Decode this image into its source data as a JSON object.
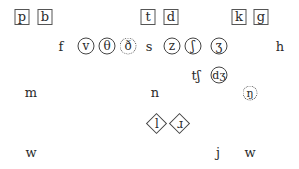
{
  "diagram": {
    "type": "phoneme-chart",
    "legend_markers": {
      "box": "plosive",
      "circle": "fricative/affricate",
      "dotted-circle": "marked phoneme",
      "diamond": "approximant/liquid",
      "plain": "unmarked"
    },
    "rows": [
      {
        "row": 1,
        "symbols": [
          {
            "label": "p",
            "marker": "box"
          },
          {
            "label": "b",
            "marker": "box"
          },
          {
            "label": "t",
            "marker": "box"
          },
          {
            "label": "d",
            "marker": "box"
          },
          {
            "label": "k",
            "marker": "box"
          },
          {
            "label": "g",
            "marker": "box"
          }
        ]
      },
      {
        "row": 2,
        "symbols": [
          {
            "label": "f",
            "marker": "plain"
          },
          {
            "label": "v",
            "marker": "circle"
          },
          {
            "label": "θ",
            "marker": "circle"
          },
          {
            "label": "ð",
            "marker": "dotted-circle"
          },
          {
            "label": "s",
            "marker": "plain"
          },
          {
            "label": "z",
            "marker": "circle"
          },
          {
            "label": "ʃ",
            "marker": "circle"
          },
          {
            "label": "ʒ",
            "marker": "circle"
          },
          {
            "label": "h",
            "marker": "plain"
          }
        ]
      },
      {
        "row": 3,
        "symbols": [
          {
            "label": "tʃ",
            "marker": "plain"
          },
          {
            "label": "dʒ",
            "marker": "circle"
          }
        ]
      },
      {
        "row": 4,
        "symbols": [
          {
            "label": "m",
            "marker": "plain"
          },
          {
            "label": "n",
            "marker": "plain"
          },
          {
            "label": "ŋ",
            "marker": "dotted-circle"
          }
        ]
      },
      {
        "row": 5,
        "symbols": [
          {
            "label": "l",
            "marker": "diamond"
          },
          {
            "label": "ɹ",
            "marker": "diamond"
          }
        ]
      },
      {
        "row": 6,
        "symbols": [
          {
            "label": "w",
            "marker": "plain"
          },
          {
            "label": "j",
            "marker": "plain"
          },
          {
            "label": "w",
            "marker": "plain"
          }
        ]
      }
    ]
  }
}
